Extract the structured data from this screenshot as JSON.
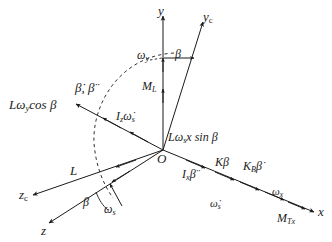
{
  "figure": {
    "type": "vector-force-diagram",
    "title": "",
    "background_color": "#ffffff",
    "stroke_color": "#1b1b1b",
    "width": 332,
    "height": 242
  },
  "axes": [
    {
      "id": "y",
      "label": "y",
      "direction": "up",
      "tip": [
        163,
        14
      ],
      "origin": [
        163,
        150
      ]
    },
    {
      "id": "yc",
      "label": "y",
      "sub": "c",
      "tip": [
        205,
        20
      ],
      "origin": [
        163,
        150
      ]
    },
    {
      "id": "x",
      "label": "x",
      "direction": "down-right",
      "tip": [
        316,
        213
      ],
      "origin": [
        163,
        150
      ]
    },
    {
      "id": "z",
      "label": "z",
      "direction": "down-left",
      "tip": [
        47,
        225
      ],
      "origin": [
        163,
        150
      ]
    },
    {
      "id": "zc",
      "label": "z",
      "sub": "c",
      "tip": [
        30,
        196
      ],
      "origin": [
        163,
        150
      ]
    },
    {
      "id": "nwl",
      "label": "",
      "direction": "up-left",
      "tip": [
        74,
        103
      ],
      "origin": [
        163,
        150
      ]
    }
  ],
  "labels": {
    "y_axis": "y",
    "yc_axis_base": "y",
    "yc_axis_sub": "c",
    "x_axis": "x",
    "z_axis": "z",
    "zc_axis_base": "z",
    "zc_axis_sub": "c",
    "origin": "O",
    "omega_y": "ω",
    "omega_y_sub": "y",
    "beta_top": "β",
    "M_L": "M",
    "M_L_sub": "L",
    "L_omega_y_cos_beta": "Lω",
    "L_omega_y_cos_beta_sub": "y",
    "L_omega_y_cos_beta_tail": "cos β",
    "beta_dot_ddot": "β̇, β̈",
    "Iz_omega_s_dot_base": "I",
    "Iz_omega_s_dot_sub": "z",
    "Iz_omega_s_dot_tail": "ω̇",
    "Iz_omega_s_dot_tail_sub": "s",
    "L_omega_s_x_sin_beta": "Lω",
    "L_omega_s_x_sin_beta_sub": "s",
    "L_omega_s_x_sin_beta_tail": "x sin β",
    "Ix_beta_ddot_base": "I",
    "Ix_beta_ddot_sub": "x",
    "Ix_beta_ddot_tail": "β̈",
    "K_beta": "Kβ",
    "KB_beta_dot_base": "K",
    "KB_beta_dot_sub": "B",
    "KB_beta_dot_tail": "β̇",
    "omega_x": "ω",
    "omega_x_sub": "x",
    "omega_s_dot": "ω̇",
    "omega_s_dot_sub": "s",
    "M_Tx": "M",
    "M_Tx_sub": "Tx",
    "L_vector": "L",
    "beta_bottom": "β",
    "omega_s_bottom": "ω",
    "omega_s_bottom_sub": "s"
  },
  "arc": {
    "name": "beta-sweep-arc",
    "style": "dashed",
    "description": "dashed arc sweeping from near y-axis top down to z-axis bottom indicating angle beta"
  },
  "vectors": [
    {
      "name": "omega-y-arrow",
      "axis": "y",
      "label": "ω_y"
    },
    {
      "name": "M-L-arrow",
      "axis": "y",
      "label": "M_L"
    },
    {
      "name": "beta-top-arrow",
      "axis": "horizontal",
      "label": "β"
    },
    {
      "name": "beta-dot-ddot-arrow",
      "axis": "nwl",
      "label": "β̇, β̈"
    },
    {
      "name": "Iz-omega-s-dot-arrow",
      "axis": "nwl",
      "label": "I_z ω̇_s"
    },
    {
      "name": "Ix-beta-ddot-arrow",
      "axis": "x",
      "label": "I_x β̈"
    },
    {
      "name": "K-beta-arrow",
      "axis": "x",
      "label": "Kβ"
    },
    {
      "name": "KB-beta-dot-arrow",
      "axis": "x",
      "label": "K_B β̇"
    },
    {
      "name": "omega-x-arrow",
      "axis": "x",
      "label": "ω_x"
    },
    {
      "name": "omega-s-dot-arrow",
      "axis": "x",
      "label": "ω̇_s"
    },
    {
      "name": "M-Tx-arrow",
      "axis": "x",
      "label": "M_Tx"
    },
    {
      "name": "L-vector-arrow",
      "axis": "zc",
      "label": "L"
    },
    {
      "name": "omega-s-arrow",
      "axis": "z",
      "label": "ω_s"
    }
  ]
}
